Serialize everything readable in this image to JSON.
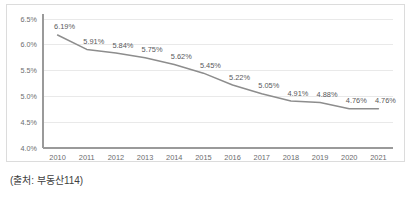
{
  "caption": {
    "source_text": "(출처: 부동산114)"
  },
  "chart_data": {
    "type": "line",
    "title": "",
    "xlabel": "",
    "ylabel": "",
    "categories": [
      "2010",
      "2011",
      "2012",
      "2013",
      "2014",
      "2015",
      "2016",
      "2017",
      "2018",
      "2019",
      "2020",
      "2021"
    ],
    "values": [
      6.19,
      5.91,
      5.84,
      5.75,
      5.62,
      5.45,
      5.22,
      5.05,
      4.91,
      4.88,
      4.76,
      4.76
    ],
    "point_labels": [
      "6.19%",
      "5.91%",
      "5.84%",
      "5.75%",
      "5.62%",
      "5.45%",
      "5.22%",
      "5.05%",
      "4.91%",
      "4.88%",
      "4.76%",
      "4.76%"
    ],
    "ylim": [
      4.0,
      6.5
    ],
    "ytick_values": [
      4.0,
      4.5,
      5.0,
      5.5,
      6.0,
      6.5
    ],
    "ytick_labels": [
      "4.0%",
      "4.5%",
      "5.0%",
      "5.5%",
      "6.0%",
      "6.5%"
    ],
    "grid": true,
    "grid_axis": "y",
    "legend": false,
    "legend_position": "none",
    "series_color": "#8d8d8d",
    "grid_color": "#e9e9e9",
    "axis_color": "#9a9a9a",
    "label_color": "#58595b",
    "marker": "none"
  }
}
